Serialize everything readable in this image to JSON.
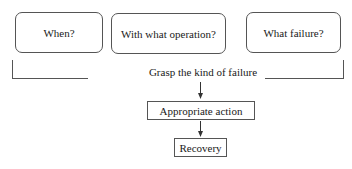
{
  "diagram": {
    "questions": [
      {
        "label": "When?"
      },
      {
        "label": "With what operation?"
      },
      {
        "label": "What failure?"
      }
    ],
    "merge_label": "Grasp the kind of failure",
    "steps": [
      {
        "label": "Appropriate action"
      },
      {
        "label": "Recovery"
      }
    ]
  }
}
